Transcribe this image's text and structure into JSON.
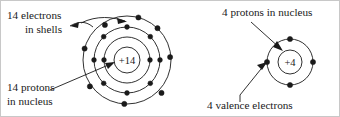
{
  "figure": {
    "background_color": "#ffffff",
    "ink_color": "#1a1a1a",
    "border_color": "#c8c8c8"
  },
  "atoms": [
    {
      "id": "silicon-atom",
      "nucleus_label": "+14",
      "nucleus_charge": 14,
      "shell_electron_counts": [
        2,
        8,
        4
      ],
      "total_electrons": 14,
      "center": {
        "x": 126,
        "y": 59
      },
      "nucleus_radius": 13,
      "shell_radii": [
        23,
        33,
        44
      ],
      "shell_electron_angles": [
        [
          180,
          0
        ],
        [
          90,
          135,
          180,
          225,
          270,
          315,
          0,
          45
        ],
        [
          105,
          150,
          195,
          250,
          290,
          345,
          30,
          70
        ]
      ]
    },
    {
      "id": "carbon-atom",
      "nucleus_label": "+4",
      "nucleus_charge": 4,
      "shell_electron_counts": [
        4
      ],
      "total_electrons": 4,
      "center": {
        "x": 289,
        "y": 61
      },
      "nucleus_radius": 12,
      "shell_radii": [
        23
      ],
      "shell_electron_angles": [
        [
          270,
          180,
          0,
          90
        ]
      ]
    }
  ],
  "labels": [
    {
      "id": "electrons-in-shells",
      "line1": "14 electrons",
      "line2": "in shells",
      "x": 6,
      "y1": 18,
      "y2": 32,
      "anchor": "start"
    },
    {
      "id": "protons-in-nucleus-left",
      "line1": "14 protons",
      "line2": "in nucleus",
      "x": 6,
      "y1": 90,
      "y2": 104,
      "anchor": "start"
    },
    {
      "id": "protons-in-nucleus-right",
      "line1": "4 protons in nucleus",
      "line2": "",
      "x": 221,
      "y1": 15,
      "y2": 0,
      "anchor": "start"
    },
    {
      "id": "valence-electrons-right",
      "line1": "4 valence electrons",
      "line2": "",
      "x": 206,
      "y1": 108,
      "y2": 0,
      "anchor": "start"
    }
  ],
  "leaders": [
    {
      "id": "electrons-leader-a",
      "from": {
        "x": 89,
        "y": 22
      },
      "to": {
        "x": 70,
        "y": 25
      },
      "arrow_at": "to"
    },
    {
      "id": "electrons-leader-b",
      "from": {
        "x": 80,
        "y": 20
      },
      "to": {
        "x": 122,
        "y": 20
      },
      "arrow_at": "to"
    },
    {
      "id": "protons-leader-left",
      "from": {
        "x": 52,
        "y": 88
      },
      "to": {
        "x": 113,
        "y": 61
      },
      "arrow_at": "to"
    },
    {
      "id": "protons-leader-right",
      "from": {
        "x": 252,
        "y": 22
      },
      "to": {
        "x": 281,
        "y": 48
      },
      "arrow_at": "to"
    },
    {
      "id": "valence-leader-right",
      "from": {
        "x": 241,
        "y": 100
      },
      "to": {
        "x": 267,
        "y": 61
      },
      "arrow_at": "to"
    }
  ]
}
